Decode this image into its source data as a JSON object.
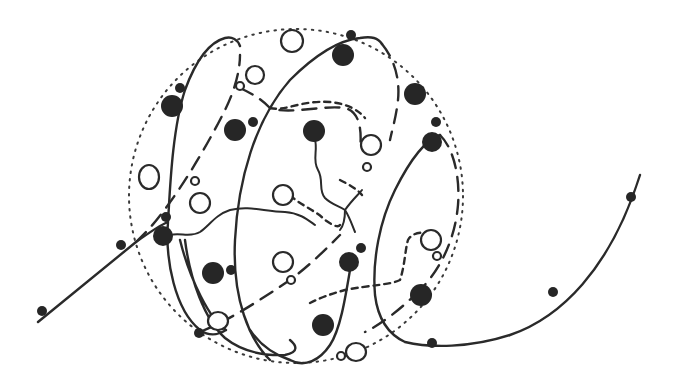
{
  "diagram": {
    "colors": {
      "ink": "#2a2a2a",
      "background": "#ffffff",
      "filled_particle": "#262626"
    },
    "sphere": {
      "cx": 296,
      "cy": 196,
      "rx": 167,
      "ry": 167,
      "style": "dotted"
    },
    "filled_particles": [
      {
        "x": 172,
        "y": 106,
        "r": 11
      },
      {
        "x": 180,
        "y": 88,
        "r": 5
      },
      {
        "x": 235,
        "y": 130,
        "r": 11
      },
      {
        "x": 253,
        "y": 122,
        "r": 5
      },
      {
        "x": 314,
        "y": 131,
        "r": 11
      },
      {
        "x": 343,
        "y": 55,
        "r": 11
      },
      {
        "x": 351,
        "y": 35,
        "r": 5
      },
      {
        "x": 415,
        "y": 94,
        "r": 11
      },
      {
        "x": 432,
        "y": 142,
        "r": 10
      },
      {
        "x": 436,
        "y": 122,
        "r": 5
      },
      {
        "x": 163,
        "y": 236,
        "r": 10
      },
      {
        "x": 166,
        "y": 217,
        "r": 5
      },
      {
        "x": 121,
        "y": 245,
        "r": 5
      },
      {
        "x": 42,
        "y": 311,
        "r": 5
      },
      {
        "x": 213,
        "y": 273,
        "r": 11
      },
      {
        "x": 231,
        "y": 270,
        "r": 5
      },
      {
        "x": 349,
        "y": 262,
        "r": 10
      },
      {
        "x": 361,
        "y": 248,
        "r": 5
      },
      {
        "x": 421,
        "y": 295,
        "r": 11
      },
      {
        "x": 323,
        "y": 325,
        "r": 11
      },
      {
        "x": 199,
        "y": 333,
        "r": 5
      },
      {
        "x": 432,
        "y": 343,
        "r": 5
      },
      {
        "x": 553,
        "y": 292,
        "r": 5
      },
      {
        "x": 631,
        "y": 197,
        "r": 5
      }
    ],
    "open_particles": [
      {
        "x": 292,
        "y": 41,
        "rx": 11,
        "ry": 11
      },
      {
        "x": 255,
        "y": 75,
        "rx": 9,
        "ry": 9
      },
      {
        "x": 240,
        "y": 86,
        "rx": 4,
        "ry": 4
      },
      {
        "x": 149,
        "y": 177,
        "rx": 10,
        "ry": 12
      },
      {
        "x": 195,
        "y": 181,
        "rx": 4,
        "ry": 4
      },
      {
        "x": 200,
        "y": 203,
        "rx": 10,
        "ry": 10
      },
      {
        "x": 283,
        "y": 195,
        "rx": 10,
        "ry": 10
      },
      {
        "x": 371,
        "y": 145,
        "rx": 10,
        "ry": 10
      },
      {
        "x": 367,
        "y": 167,
        "rx": 4,
        "ry": 4
      },
      {
        "x": 431,
        "y": 240,
        "rx": 10,
        "ry": 10
      },
      {
        "x": 437,
        "y": 256,
        "rx": 4,
        "ry": 4
      },
      {
        "x": 283,
        "y": 262,
        "rx": 10,
        "ry": 10
      },
      {
        "x": 291,
        "y": 280,
        "rx": 4,
        "ry": 4
      },
      {
        "x": 218,
        "y": 321,
        "rx": 10,
        "ry": 9
      },
      {
        "x": 356,
        "y": 352,
        "rx": 10,
        "ry": 9
      },
      {
        "x": 341,
        "y": 356,
        "rx": 4,
        "ry": 4
      }
    ]
  }
}
